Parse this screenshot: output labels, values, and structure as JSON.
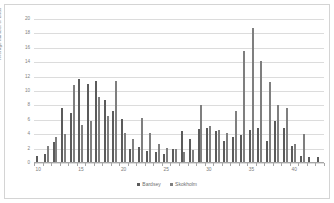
{
  "chart_data": {
    "type": "bar",
    "title": "",
    "xlabel": "",
    "ylabel": "Average number of birds",
    "ylim": [
      0,
      20
    ],
    "ytick_values": [
      0,
      2,
      4,
      6,
      8,
      10,
      12,
      14,
      16,
      18,
      20
    ],
    "xtick_values": [
      10,
      15,
      20,
      25,
      30,
      35,
      40
    ],
    "grid": true,
    "legend_position": "bottom",
    "categories": [
      10,
      11,
      12,
      13,
      14,
      15,
      16,
      17,
      18,
      19,
      20,
      21,
      22,
      23,
      24,
      25,
      26,
      27,
      28,
      29,
      30,
      31,
      32,
      33,
      34,
      35,
      36,
      37,
      38,
      39,
      40,
      41,
      42,
      43
    ],
    "series": [
      {
        "name": "Bardsey",
        "color": "#5b5b5b",
        "values": [
          1.0,
          1.3,
          2.9,
          7.6,
          6.9,
          11.6,
          11.0,
          11.4,
          8.7,
          7.2,
          6.1,
          2.0,
          2.2,
          1.7,
          1.5,
          1.2,
          1.9,
          4.4,
          3.4,
          4.7,
          4.8,
          4.4,
          3.1,
          3.6,
          3.9,
          4.6,
          4.9,
          3.0,
          5.8,
          4.9,
          2.4,
          1.0,
          0.9,
          0.9
        ]
      },
      {
        "name": "Skokholm",
        "color": "#7f7f7f",
        "values": [
          0.2,
          2.4,
          3.6,
          4.0,
          10.9,
          5.3,
          5.8,
          9.2,
          6.5,
          11.4,
          4.1,
          3.4,
          6.2,
          4.2,
          2.6,
          2.1,
          2.0,
          1.5,
          1.8,
          8.0,
          5.2,
          4.6,
          4.2,
          7.2,
          15.5,
          18.8,
          14.2,
          11.2,
          8.1,
          7.6,
          2.7,
          4.0,
          0.0,
          0.0
        ]
      }
    ]
  },
  "legend": {
    "items": [
      {
        "label": "Bardsey",
        "color": "#5b5b5b"
      },
      {
        "label": "Skokholm",
        "color": "#7f7f7f"
      }
    ]
  },
  "axes": {
    "y_title": "Average number of birds"
  }
}
